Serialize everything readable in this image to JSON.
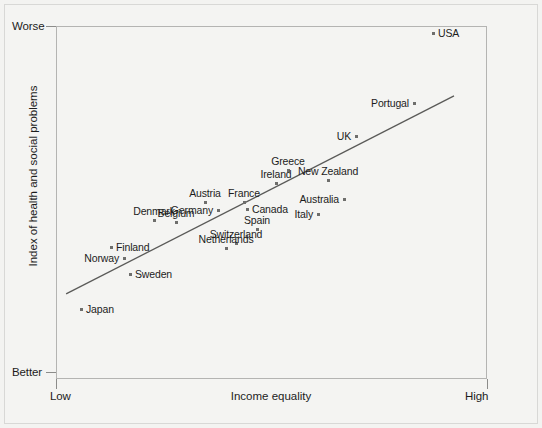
{
  "chart_data": {
    "type": "scatter",
    "title": "",
    "xlabel": "Income equality",
    "ylabel": "Index of health and social problems",
    "x_ticks": [
      "Low",
      "High"
    ],
    "y_ticks": [
      "Worse",
      "Better"
    ],
    "xlim": [
      0,
      1
    ],
    "ylim": [
      0,
      1
    ],
    "grid": false,
    "legend": "none",
    "trendline": {
      "x0": 0.021,
      "y0": 0.756,
      "x1": 0.921,
      "y1": 0.195
    },
    "points": [
      {
        "label": "USA",
        "px": 432,
        "py": 32,
        "label_pos": "right"
      },
      {
        "label": "Portugal",
        "px": 413,
        "py": 102,
        "label_pos": "left"
      },
      {
        "label": "UK",
        "px": 355,
        "py": 135,
        "label_pos": "left"
      },
      {
        "label": "Greece",
        "px": 287,
        "py": 169,
        "label_pos": "above"
      },
      {
        "label": "New Zealand",
        "px": 327,
        "py": 179,
        "label_pos": "above"
      },
      {
        "label": "Ireland",
        "px": 275,
        "py": 182,
        "label_pos": "above"
      },
      {
        "label": "Australia",
        "px": 343,
        "py": 198,
        "label_pos": "left"
      },
      {
        "label": "Austria",
        "px": 204,
        "py": 201,
        "label_pos": "above"
      },
      {
        "label": "France",
        "px": 243,
        "py": 201,
        "label_pos": "above"
      },
      {
        "label": "Canada",
        "px": 246,
        "py": 208,
        "label_pos": "right"
      },
      {
        "label": "Germany",
        "px": 217,
        "py": 209,
        "label_pos": "left"
      },
      {
        "label": "Italy",
        "px": 317,
        "py": 213,
        "label_pos": "left"
      },
      {
        "label": "Denmark",
        "px": 153,
        "py": 219,
        "label_pos": "above"
      },
      {
        "label": "Belgium",
        "px": 175,
        "py": 221,
        "label_pos": "above"
      },
      {
        "label": "Spain",
        "px": 256,
        "py": 228,
        "label_pos": "above"
      },
      {
        "label": "Switzerland",
        "px": 235,
        "py": 242,
        "label_pos": "above"
      },
      {
        "label": "Netherlands",
        "px": 225,
        "py": 247,
        "label_pos": "above"
      },
      {
        "label": "Finland",
        "px": 110,
        "py": 246,
        "label_pos": "right"
      },
      {
        "label": "Norway",
        "px": 123,
        "py": 257,
        "label_pos": "left"
      },
      {
        "label": "Sweden",
        "px": 129,
        "py": 273,
        "label_pos": "right"
      },
      {
        "label": "Japan",
        "px": 80,
        "py": 308,
        "label_pos": "right"
      }
    ]
  },
  "axes": {
    "y_top_label": "Worse",
    "y_bottom_label": "Better",
    "y_title": "Index of health and social problems",
    "x_left_label": "Low",
    "x_right_label": "High",
    "x_title": "Income equality"
  },
  "colors": {
    "background": "#f3f3f1",
    "frame": "#b4b4b2",
    "point": "#6e6e6c",
    "text": "#1c1c1c",
    "trendline": "#5a5a58"
  }
}
